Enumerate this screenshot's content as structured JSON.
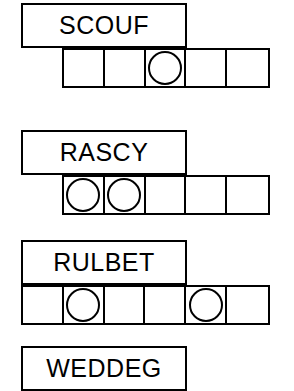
{
  "sheet": {
    "title": "word scramble puzzle worksheet",
    "ink_color": "#000000",
    "paper_color": "#ffffff"
  },
  "puzzles": [
    {
      "id": "puzzle-1",
      "word": "SCOUF",
      "word_box": {
        "x": 21,
        "y": 3,
        "width": 166,
        "height": 45
      },
      "grid": {
        "x": 62,
        "y": 48,
        "width": 208,
        "height": 40,
        "cells": 5
      },
      "circle_cells": [
        3
      ]
    },
    {
      "id": "puzzle-2",
      "word": "RASCY",
      "word_box": {
        "x": 21,
        "y": 130,
        "width": 166,
        "height": 45
      },
      "grid": {
        "x": 62,
        "y": 175,
        "width": 208,
        "height": 40,
        "cells": 5
      },
      "circle_cells": [
        1,
        2
      ]
    },
    {
      "id": "puzzle-3",
      "word": "RULBET",
      "word_box": {
        "x": 21,
        "y": 240,
        "width": 166,
        "height": 45
      },
      "grid": {
        "x": 21,
        "y": 285,
        "width": 249,
        "height": 40,
        "cells": 6
      },
      "circle_cells": [
        2,
        5
      ]
    },
    {
      "id": "puzzle-4",
      "word": "WEDDEG",
      "word_box": {
        "x": 21,
        "y": 346,
        "width": 166,
        "height": 45
      },
      "grid": null,
      "circle_cells": []
    }
  ]
}
